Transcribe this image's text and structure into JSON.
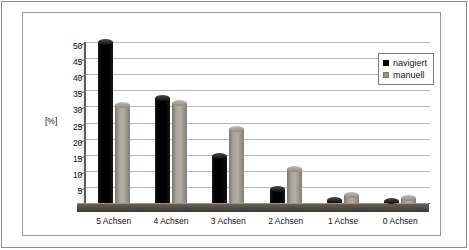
{
  "chart_data": {
    "type": "bar",
    "title": "",
    "xlabel": "",
    "ylabel": "[%]",
    "ylim": [
      0,
      50
    ],
    "yticks": [
      0,
      5,
      10,
      15,
      20,
      25,
      30,
      35,
      40,
      45,
      50
    ],
    "grid": true,
    "legend_position": "top-right",
    "categories": [
      "5 Achsen",
      "4 Achsen",
      "3 Achsen",
      "2 Achsen",
      "1 Achse",
      "0 Achsen"
    ],
    "series": [
      {
        "name": "navigiert",
        "color": "#000000",
        "values": [
          50,
          32.5,
          14.5,
          4.5,
          1,
          0.5
        ]
      },
      {
        "name": "manuell",
        "color": "#9a948b",
        "values": [
          30.5,
          31,
          23,
          10.5,
          2.5,
          1.5
        ]
      }
    ]
  },
  "legend": {
    "items": [
      {
        "label": "navigiert"
      },
      {
        "label": "manuell"
      }
    ]
  },
  "axis": {
    "y_title": "[%]"
  }
}
